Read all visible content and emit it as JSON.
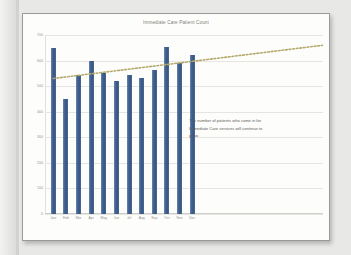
{
  "annotation": {
    "text": "The number of patients who come in for Immediate Care services will continue to grow."
  },
  "colors": {
    "bar": "#3f5f8e",
    "trendline": "#b3a96a",
    "gridline": "#e6e5e0",
    "title_text": "#7e7d78",
    "axis_text": "#97968f",
    "page_background": "#fdfdfc",
    "slide_background": "#e8e8e6"
  },
  "chart_data": {
    "type": "bar",
    "title": "Immediate Care Patient Count",
    "xlabel": "",
    "ylabel": "",
    "categories": [
      "Jan",
      "Feb",
      "Mar",
      "Apr",
      "May",
      "Jun",
      "Jul",
      "Aug",
      "Sep",
      "Oct",
      "Nov",
      "Dec"
    ],
    "values": [
      650,
      450,
      545,
      600,
      550,
      520,
      545,
      530,
      565,
      655,
      590,
      620
    ],
    "ylim": [
      0,
      700
    ],
    "yticks": [
      0,
      100,
      200,
      300,
      400,
      500,
      600,
      700
    ],
    "ytick_labels": [
      "0",
      "100",
      "200",
      "300",
      "400",
      "500",
      "600",
      "700"
    ],
    "grid": true,
    "legend": "none",
    "series": [
      {
        "name": "Patient Count",
        "type": "bar",
        "values": [
          650,
          450,
          545,
          600,
          550,
          520,
          545,
          530,
          565,
          655,
          590,
          620
        ]
      },
      {
        "name": "Trendline",
        "type": "line",
        "style": "dotted",
        "extends_beyond_data": true,
        "start_value": 530,
        "end_value_at_dec": 600,
        "forecast_end_value": 660
      }
    ],
    "annotations": [
      "The number of patients who come in for Immediate Care services will continue to grow."
    ]
  }
}
